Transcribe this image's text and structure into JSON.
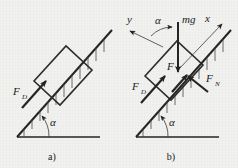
{
  "figure": {
    "background_color": "#f1f1ef",
    "ink_color": "#242424",
    "panels": [
      {
        "id": "a",
        "caption": "a)",
        "angle_label": "α",
        "labels": [
          {
            "name": "force-fd",
            "base": "F",
            "sub": "D"
          }
        ]
      },
      {
        "id": "b",
        "caption": "b)",
        "angle_label_incline": "α",
        "angle_label_axes": "α",
        "labels": [
          {
            "name": "axis-y",
            "base": "y",
            "sub": ""
          },
          {
            "name": "axis-x",
            "base": "x",
            "sub": ""
          },
          {
            "name": "weight-mg",
            "base": "mg",
            "sub": ""
          },
          {
            "name": "force-fd",
            "base": "F",
            "sub": "D"
          },
          {
            "name": "force-f",
            "base": "F",
            "sub": ""
          },
          {
            "name": "force-fn",
            "base": "F",
            "sub": "N"
          }
        ]
      }
    ]
  },
  "panel_a": {
    "caption": "a)",
    "alpha": "α",
    "fd_base": "F",
    "fd_sub": "D"
  },
  "panel_b": {
    "caption": "b)",
    "alpha_incline": "α",
    "alpha_axes": "α",
    "y_axis": "y",
    "x_axis": "x",
    "mg": "mg",
    "fd_base": "F",
    "fd_sub": "D",
    "f_base": "F",
    "fn_base": "F",
    "fn_sub": "N"
  }
}
